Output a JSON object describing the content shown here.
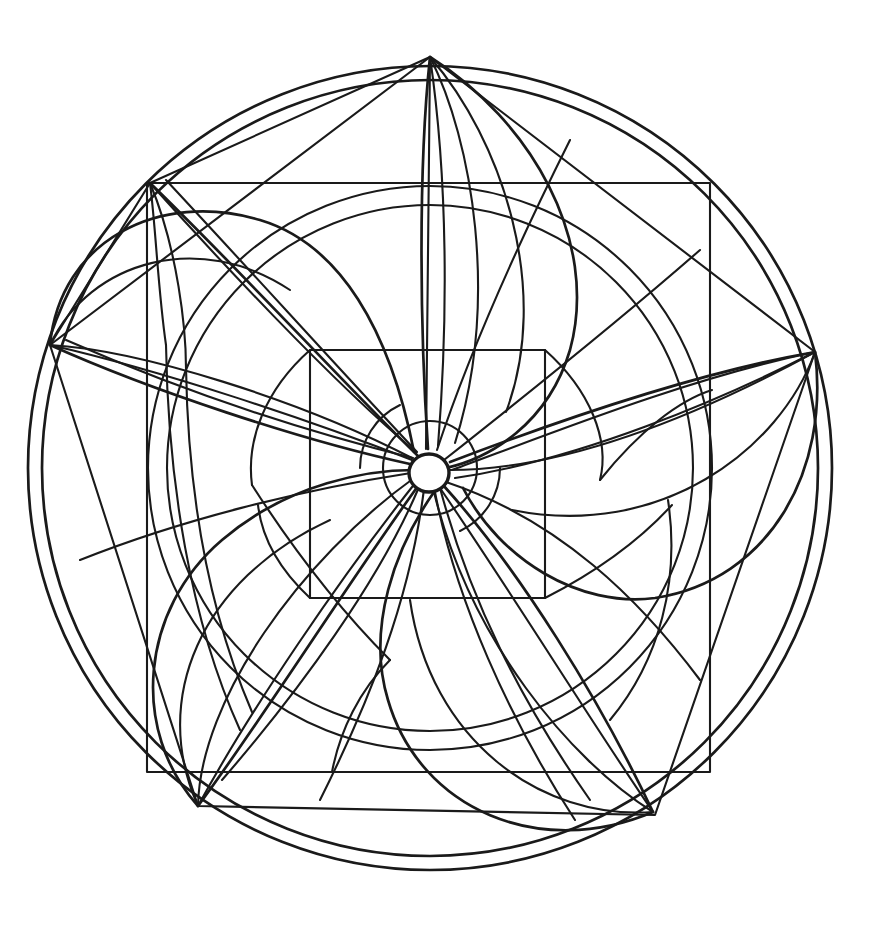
{
  "page": {
    "width": 885,
    "height": 940,
    "background_color": "#ffffff",
    "line_color": "#1a1a1a"
  },
  "artwork": {
    "name": "pinwheel-rosette-mandala",
    "style": "line-art",
    "fill": "none",
    "center": {
      "x": 430,
      "y": 468
    },
    "petal_count": 6,
    "veins_per_petal": 3,
    "rotation_direction": "counter-clockwise",
    "geometry": {
      "outer_circles": [
        {
          "name": "outer-circle-1",
          "radius": 402
        },
        {
          "name": "outer-circle-2",
          "radius": 388
        }
      ],
      "inner_circles": [
        {
          "name": "inner-circle-1",
          "radius": 282
        },
        {
          "name": "inner-circle-2",
          "radius": 263
        }
      ],
      "center_arc_radius": 47,
      "hub_radius": 19,
      "axis_square": {
        "x1": 147,
        "y1": 183,
        "x2": 710,
        "y2": 772
      },
      "rotated_square": {
        "points": [
          {
            "x": 430,
            "y": 57
          },
          {
            "x": 815,
            "y": 352
          },
          {
            "x": 655,
            "y": 815
          },
          {
            "x": 198,
            "y": 806
          },
          {
            "x": 50,
            "y": 345
          }
        ]
      },
      "inner_rectangle": {
        "x1": 310,
        "y1": 350,
        "x2": 545,
        "y2": 598
      },
      "petal_tips": [
        {
          "name": "petal-tip-top",
          "x": 430,
          "y": 57
        },
        {
          "name": "petal-tip-upper-right",
          "x": 815,
          "y": 352
        },
        {
          "name": "petal-tip-lower-right",
          "x": 653,
          "y": 812
        },
        {
          "name": "petal-tip-bottom-left",
          "x": 198,
          "y": 806
        },
        {
          "name": "petal-tip-left",
          "x": 50,
          "y": 345
        },
        {
          "name": "petal-tip-upper-left",
          "x": 150,
          "y": 183
        }
      ]
    }
  },
  "chart_data": {
    "type": "line",
    "xlabel": "",
    "ylabel": "",
    "categories": [
      "outer-circle-1",
      "outer-circle-2",
      "inner-circle-1",
      "inner-circle-2",
      "axis-square",
      "rotated-square",
      "inner-rectangle",
      "center-hub",
      "petals"
    ],
    "values": [
      402,
      388,
      282,
      263,
      563,
      770,
      248,
      19,
      6
    ]
  }
}
